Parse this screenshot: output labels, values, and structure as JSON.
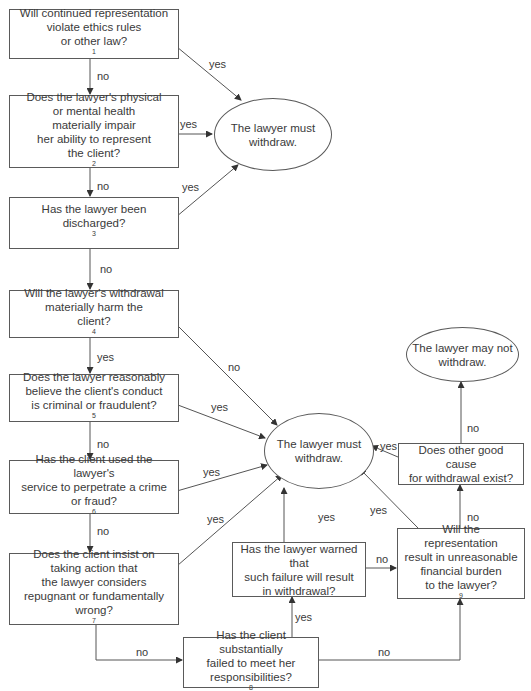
{
  "diagram": {
    "type": "flowchart",
    "nodes": {
      "q1": {
        "text": "Will continued representation\nviolate ethics rules\nor other law?",
        "footnote": "1"
      },
      "q2": {
        "text": "Does the lawyer's physical\nor mental health\nmaterially impair\nher ability to represent\nthe client?",
        "footnote": "2"
      },
      "q3": {
        "text": "Has the lawyer been\ndischarged?",
        "footnote": "3"
      },
      "q4": {
        "text": "Will the lawyer's withdrawal\nmaterially harm the\nclient?",
        "footnote": "4"
      },
      "q5": {
        "text": "Does the lawyer reasonably\nbelieve the client's conduct\nis criminal or fraudulent?",
        "footnote": "5"
      },
      "q6": {
        "text": "Has the client used the lawyer's\nservice to perpetrate a crime\nor fraud?",
        "footnote": "6"
      },
      "q7": {
        "text": "Does the client insist on\ntaking action that\nthe lawyer considers\nrepugnant or fundamentally\nwrong?",
        "footnote": "7"
      },
      "q8": {
        "text": "Has the client substantially\nfailed to meet her\nresponsibilities?",
        "footnote": "8"
      },
      "q9": {
        "text": "Has the lawyer warned that\nsuch failure will result\nin withdrawal?"
      },
      "q10": {
        "text": "Will the representation\nresult in unreasonable\nfinancial burden\nto the lawyer?",
        "footnote": "9"
      },
      "q11": {
        "text": "Does other good cause\nfor withdrawal exist?"
      },
      "must_withdraw_top": {
        "text": "The lawyer must\nwithdraw."
      },
      "must_withdraw_mid": {
        "text": "The lawyer must\nwithdraw."
      },
      "may_not_withdraw": {
        "text": "The lawyer may not\nwithdraw."
      }
    },
    "edge_labels": {
      "q1_no": "no",
      "q1_yes": "yes",
      "q2_no": "no",
      "q2_yes": "yes",
      "q3_no": "no",
      "q3_yes": "yes",
      "q4_yes": "yes",
      "q4_no": "no",
      "q5_no": "no",
      "q5_yes": "yes",
      "q6_no": "no",
      "q6_yes": "yes",
      "q7_yes": "yes",
      "q7_no": "no",
      "q8_yes": "yes",
      "q8_no": "no",
      "q9_yes": "yes",
      "q9_no": "no",
      "q10_yes": "yes",
      "q10_no": "no",
      "q11_yes": "yes",
      "q11_no": "no"
    },
    "edges": [
      {
        "from": "q1",
        "to": "q2",
        "label": "no"
      },
      {
        "from": "q1",
        "to": "must_withdraw_top",
        "label": "yes"
      },
      {
        "from": "q2",
        "to": "q3",
        "label": "no"
      },
      {
        "from": "q2",
        "to": "must_withdraw_top",
        "label": "yes"
      },
      {
        "from": "q3",
        "to": "q4",
        "label": "no"
      },
      {
        "from": "q3",
        "to": "must_withdraw_top",
        "label": "yes"
      },
      {
        "from": "q4",
        "to": "q5",
        "label": "yes"
      },
      {
        "from": "q4",
        "to": "must_withdraw_mid",
        "label": "no"
      },
      {
        "from": "q5",
        "to": "q6",
        "label": "no"
      },
      {
        "from": "q5",
        "to": "must_withdraw_mid",
        "label": "yes"
      },
      {
        "from": "q6",
        "to": "q7",
        "label": "no"
      },
      {
        "from": "q6",
        "to": "must_withdraw_mid",
        "label": "yes"
      },
      {
        "from": "q7",
        "to": "must_withdraw_mid",
        "label": "yes"
      },
      {
        "from": "q7",
        "to": "q8",
        "label": "no"
      },
      {
        "from": "q8",
        "to": "q9",
        "label": "yes"
      },
      {
        "from": "q8",
        "to": "q10",
        "label": "no"
      },
      {
        "from": "q9",
        "to": "must_withdraw_mid",
        "label": "yes"
      },
      {
        "from": "q9",
        "to": "q10",
        "label": "no"
      },
      {
        "from": "q10",
        "to": "must_withdraw_mid",
        "label": "yes"
      },
      {
        "from": "q10",
        "to": "q11",
        "label": "no"
      },
      {
        "from": "q11",
        "to": "must_withdraw_mid",
        "label": "yes"
      },
      {
        "from": "q11",
        "to": "may_not_withdraw",
        "label": "no"
      }
    ]
  }
}
